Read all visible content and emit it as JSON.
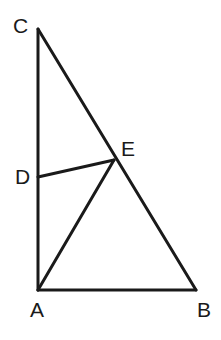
{
  "figure": {
    "background_color": "#ffffff",
    "stroke_color": "#1a1a1a",
    "stroke_width": 3,
    "canvas": {
      "width": 221,
      "height": 340
    }
  },
  "points": {
    "A": {
      "label": "A",
      "x": 38,
      "y": 290,
      "label_x": 30,
      "label_y": 299
    },
    "B": {
      "label": "B",
      "x": 196,
      "y": 290,
      "label_x": 197,
      "label_y": 299
    },
    "C": {
      "label": "C",
      "x": 38,
      "y": 29,
      "label_x": 13,
      "label_y": 15
    },
    "D": {
      "label": "D",
      "x": 38,
      "y": 177,
      "label_x": 15,
      "label_y": 166
    },
    "E": {
      "label": "E",
      "x": 114,
      "y": 160,
      "label_x": 121,
      "label_y": 138
    }
  },
  "segments": [
    {
      "name": "segment-CA",
      "from": "C",
      "to": "A",
      "path": "M 38 29 L 38 290"
    },
    {
      "name": "segment-AB",
      "from": "A",
      "to": "B",
      "path": "M 38 290 L 196 290"
    },
    {
      "name": "segment-CB",
      "from": "C",
      "to": "B",
      "path": "M 38 29 L 196 290"
    },
    {
      "name": "segment-DE",
      "from": "D",
      "to": "E",
      "path": "M 38 177 L 114 160"
    },
    {
      "name": "segment-AE",
      "from": "A",
      "to": "E",
      "path": "M 38 290 L 114 160"
    }
  ]
}
